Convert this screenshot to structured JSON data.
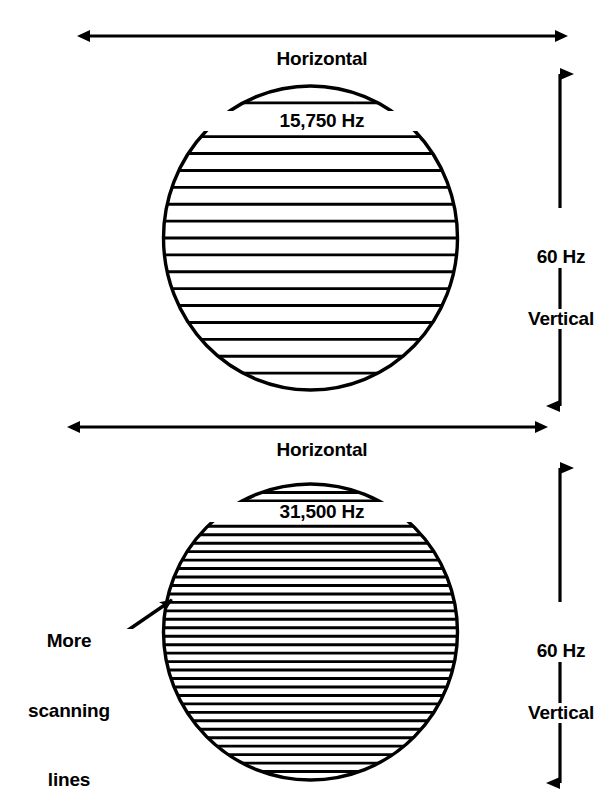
{
  "figure": {
    "background_color": "#ffffff",
    "stroke_color": "#000000"
  },
  "panels": [
    {
      "id": "standard-scan",
      "horizontal_label": {
        "line1": "Horizontal",
        "line2": "15,750 Hz"
      },
      "vertical_label": {
        "line1": "60 Hz",
        "line2": "Vertical"
      },
      "raster": {
        "scan_line_count": 17,
        "shape": "circle"
      }
    },
    {
      "id": "double-scan",
      "horizontal_label": {
        "line1": "Horizontal",
        "line2": "31,500 Hz"
      },
      "vertical_label": {
        "line1": "60 Hz",
        "line2": "Vertical"
      },
      "raster": {
        "scan_line_count": 34,
        "shape": "circle"
      },
      "callout": {
        "line1": "More",
        "line2": "scanning",
        "line3": "lines"
      }
    }
  ],
  "chart_data": {
    "type": "diagram",
    "categories": [
      "15,750 Hz horizontal / 60 Hz vertical",
      "31,500 Hz horizontal / 60 Hz vertical"
    ],
    "values": [
      17,
      34
    ],
    "xlabel": "Horizontal scan frequency",
    "ylabel": "Visible scanning lines on raster",
    "annotations": [
      "More scanning lines"
    ],
    "grid": false,
    "legend": "none"
  }
}
